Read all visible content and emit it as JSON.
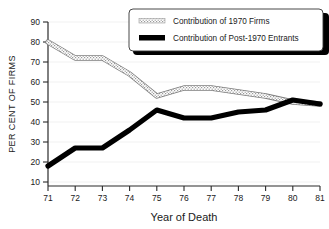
{
  "chart_data": {
    "type": "line",
    "title": "",
    "xlabel": "Year of Death",
    "ylabel": "PER CENT OF FIRMS",
    "x": [
      71,
      72,
      73,
      74,
      75,
      76,
      77,
      78,
      79,
      80,
      81
    ],
    "xtick_labels": [
      "71",
      "72",
      "73",
      "74",
      "75",
      "76",
      "77",
      "78",
      "79",
      "80",
      "81"
    ],
    "ytick_labels": [
      "10",
      "20",
      "30",
      "40",
      "50",
      "60",
      "70",
      "80",
      "90"
    ],
    "xlim": [
      71,
      81
    ],
    "ylim": [
      10,
      90
    ],
    "grid": true,
    "legend_position": "top-right",
    "series": [
      {
        "name": "Contribution of 1970 Firms",
        "style": "hatched-outline",
        "color": "#b9b9b9",
        "values": [
          80,
          72,
          72,
          64,
          53,
          57,
          57,
          55,
          53,
          50,
          49
        ]
      },
      {
        "name": "Contribution of Post-1970 Entrants",
        "style": "solid-thick",
        "color": "#000000",
        "values": [
          18,
          27,
          27,
          36,
          46,
          42,
          42,
          45,
          46,
          51,
          49
        ]
      }
    ]
  },
  "legend": {
    "items": [
      {
        "label": "Contribution of 1970 Firms",
        "swatch": "hatched-swatch"
      },
      {
        "label": "Contribution of Post-1970 Entrants",
        "swatch": "solid-swatch"
      }
    ]
  },
  "axes": {
    "x_title": "Year of Death",
    "y_title": "PER CENT OF FIRMS"
  }
}
